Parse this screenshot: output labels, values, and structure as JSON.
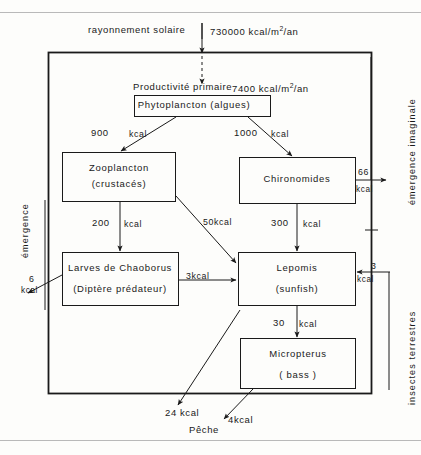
{
  "figure": {
    "title_caption": "",
    "language": "fr",
    "ink_color": "#1a1a1a",
    "rule_color": "#b9b9b9",
    "background": "#fdfdfb"
  },
  "inputs": {
    "solar_label": "rayonnement solaire",
    "solar_value": "730000 kcal/m",
    "solar_value_exp": "2",
    "solar_value_tail": "/an",
    "primary_label": "Productivité primaire",
    "primary_value": "7400 kcal/m",
    "primary_value_exp": "2",
    "primary_value_tail": "/an"
  },
  "nodes": [
    {
      "id": "phytoplancton",
      "line1": "Phytoplancton (algues)",
      "line2": ""
    },
    {
      "id": "zooplancton",
      "line1": "Zooplancton",
      "line2": "(crustacés)"
    },
    {
      "id": "chironomides",
      "line1": "Chironomides",
      "line2": ""
    },
    {
      "id": "chaoborus",
      "line1": "Larves de Chaoborus",
      "line2": "(Diptère  prédateur)"
    },
    {
      "id": "lepomis",
      "line1": "Lepomis",
      "line2": "(sunfish)"
    },
    {
      "id": "micropterus",
      "line1": "Micropterus",
      "line2": "( bass )"
    }
  ],
  "flows": [
    {
      "id": "phyto-to-zoo",
      "value": "900",
      "unit": "kcal"
    },
    {
      "id": "phyto-to-chiro",
      "value": "1000",
      "unit": "kcal"
    },
    {
      "id": "zoo-to-chaoborus",
      "value": "200",
      "unit": "kcal"
    },
    {
      "id": "zoo-to-lepomis",
      "value": "50kcal",
      "unit": ""
    },
    {
      "id": "chiro-to-lepomis",
      "value": "300",
      "unit": "kcal"
    },
    {
      "id": "chaoborus-to-lepomis",
      "value": "3kcal",
      "unit": ""
    },
    {
      "id": "lepomis-to-micropterus",
      "value": "30",
      "unit": "kcal"
    },
    {
      "id": "chiro-emergence",
      "value": "66",
      "unit": "kcal"
    },
    {
      "id": "chaoborus-emergence",
      "value": "6",
      "unit": "kcal"
    },
    {
      "id": "terrestrial-to-lepomis",
      "value": "3",
      "unit": "kcal"
    },
    {
      "id": "lepomis-fishery",
      "value": "24 kcal",
      "unit": ""
    },
    {
      "id": "micropterus-fishery",
      "value": "4kcal",
      "unit": ""
    }
  ],
  "side_labels": {
    "left_emergence": "émergence",
    "right_emergence": "émergence  imaginale",
    "right_terrestrial": "insectes   terrestres"
  },
  "bottom": {
    "fishery": "Pêche"
  }
}
